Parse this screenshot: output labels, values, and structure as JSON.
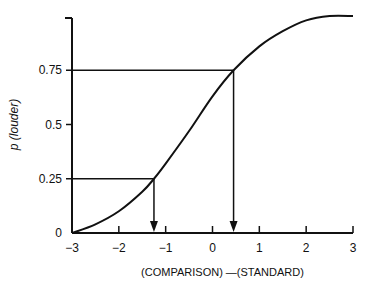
{
  "chart_data": {
    "type": "line",
    "title": "",
    "xlabel": "(COMPARISON) —(STANDARD)",
    "ylabel": "p (louder)",
    "xlim": [
      -3,
      3
    ],
    "ylim": [
      0,
      1
    ],
    "x_ticks": [
      -3,
      -2,
      -1,
      0,
      1,
      2,
      3
    ],
    "x_tick_labels": [
      "−3",
      "−2",
      "−1",
      "0",
      "1",
      "2",
      "3"
    ],
    "y_ticks": [
      0,
      0.25,
      0.5,
      0.75
    ],
    "y_tick_labels": [
      "0",
      "0.25",
      "0.5",
      "0.75"
    ],
    "grid": false,
    "series": [
      {
        "name": "psychometric function",
        "x": [
          -3,
          -2.5,
          -2,
          -1.5,
          -1.25,
          -1,
          -0.5,
          0,
          0.45,
          1,
          1.5,
          2,
          2.5,
          3
        ],
        "y": [
          0,
          0.04,
          0.1,
          0.19,
          0.25,
          0.32,
          0.47,
          0.63,
          0.75,
          0.86,
          0.93,
          0.98,
          1.0,
          1.0
        ]
      }
    ],
    "annotations": [
      {
        "type": "drop-line",
        "p": 0.25,
        "x": -1.25
      },
      {
        "type": "drop-line",
        "p": 0.75,
        "x": 0.45
      }
    ]
  }
}
